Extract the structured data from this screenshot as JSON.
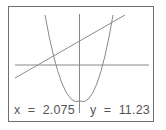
{
  "screen": {
    "type": "graphing-calculator-display",
    "colors": {
      "border": "#6e6e6e",
      "axes": "#888888",
      "curves": "#8a8a8a",
      "text": "#555555",
      "background": "#ffffff"
    }
  },
  "graph": {
    "axes": {
      "x_axis": "horizontal",
      "y_axis": "vertical"
    },
    "curves": [
      {
        "name": "parabola",
        "shape": "upward-opening parabola with vertex below x-axis"
      },
      {
        "name": "line",
        "shape": "increasing straight line"
      }
    ]
  },
  "readout": {
    "x_label": "x",
    "x_value": "2.075",
    "x_text": "x  =  2.075",
    "y_label": "y",
    "y_value": "11.23",
    "y_text": "y  =  11.23"
  }
}
